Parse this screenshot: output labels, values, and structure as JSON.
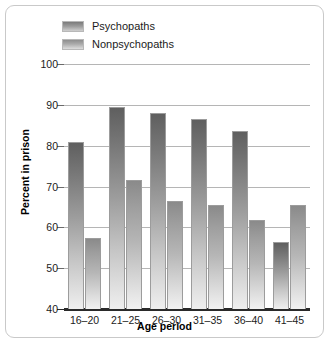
{
  "chart_data": {
    "type": "bar",
    "title": "",
    "xlabel": "Age period",
    "ylabel": "Percent in prison",
    "categories": [
      "16–20",
      "21–25",
      "26–30",
      "31–35",
      "36–40",
      "41–45"
    ],
    "series": [
      {
        "name": "Psychopaths",
        "values": [
          81,
          89.5,
          88,
          86.5,
          83.5,
          56.5
        ],
        "color": "#7b7b7b"
      },
      {
        "name": "Nonpsychopaths",
        "values": [
          57.5,
          71.5,
          66.5,
          65.5,
          61.8,
          65.5
        ],
        "color": "#ababab"
      }
    ],
    "ylim": [
      40,
      100
    ],
    "ytick_values": [
      40,
      50,
      60,
      70,
      80,
      90,
      100
    ],
    "ytick_labels": [
      "40",
      "50",
      "60",
      "70",
      "80",
      "90",
      "100"
    ],
    "grid": true,
    "legend_position": "top-left"
  },
  "legend": {
    "items": [
      {
        "label": "Psychopaths",
        "swatch": "psychopaths-swatch"
      },
      {
        "label": "Nonpsychopaths",
        "swatch": "nonpsychopaths-swatch"
      }
    ]
  }
}
